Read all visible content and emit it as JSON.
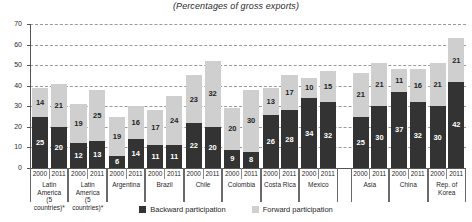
{
  "chart_data": {
    "type": "bar",
    "title": "(Percentages of gross exports)",
    "subtitle": "",
    "xlabel": "",
    "ylabel": "",
    "ylim": [
      0,
      70
    ],
    "yticks": [
      0,
      10,
      20,
      30,
      40,
      50,
      60,
      70
    ],
    "grid": true,
    "stacked": true,
    "legend_position": "bottom",
    "legend": [
      {
        "name": "Backward participation",
        "color": "#333333"
      },
      {
        "name": "Forward participation",
        "color": "#cfcfcf"
      }
    ],
    "series": [
      {
        "name": "Backward participation",
        "color": "#333333",
        "values": [
          25,
          20,
          12,
          13,
          6,
          14,
          11,
          11,
          22,
          20,
          9,
          8,
          26,
          28,
          34,
          32,
          25,
          30,
          37,
          32,
          30,
          42
        ]
      },
      {
        "name": "Forward participation",
        "color": "#cfcfcf",
        "values": [
          14,
          21,
          19,
          25,
          19,
          16,
          17,
          24,
          23,
          32,
          20,
          30,
          13,
          17,
          10,
          15,
          21,
          21,
          11,
          16,
          21,
          21
        ]
      }
    ],
    "groups": [
      {
        "name": "Latin\nAmerica\n(5 countries)*",
        "years": [
          "2000",
          "2011"
        ]
      },
      {
        "name": "Latin\nAmerica\n(5 countries)*",
        "years": [
          "2000",
          "2011"
        ]
      },
      {
        "name": "Argentina",
        "years": [
          "2000",
          "2011"
        ]
      },
      {
        "name": "Brazil",
        "years": [
          "2000",
          "2011"
        ]
      },
      {
        "name": "Chile",
        "years": [
          "2000",
          "2011"
        ]
      },
      {
        "name": "Colombia",
        "years": [
          "2000",
          "2011"
        ]
      },
      {
        "name": "Costa Rica",
        "years": [
          "2000",
          "2011"
        ]
      },
      {
        "name": "Mexico",
        "years": [
          "2000",
          "2011"
        ]
      },
      {
        "name": "Asia",
        "years": [
          "2000",
          "2011"
        ]
      },
      {
        "name": "China",
        "years": [
          "2000",
          "2011"
        ]
      },
      {
        "name": "Rep. of\nKorea",
        "years": [
          "2000",
          "2011"
        ]
      }
    ],
    "bars": [
      {
        "group": "Latin America (5 countries)*",
        "year": "2000",
        "backward": 25,
        "forward": 14,
        "total": 39
      },
      {
        "group": "Latin America (5 countries)*",
        "year": "2011",
        "backward": 20,
        "forward": 21,
        "total": 41
      },
      {
        "group": "Latin America (5 countries)*",
        "year": "2000",
        "backward": 12,
        "forward": 19,
        "total": 31
      },
      {
        "group": "Latin America (5 countries)*",
        "year": "2011",
        "backward": 13,
        "forward": 25,
        "total": 38
      },
      {
        "group": "Argentina",
        "year": "2000",
        "backward": 6,
        "forward": 19,
        "total": 25
      },
      {
        "group": "Argentina",
        "year": "2011",
        "backward": 14,
        "forward": 16,
        "total": 30
      },
      {
        "group": "Brazil",
        "year": "2000",
        "backward": 11,
        "forward": 17,
        "total": 28
      },
      {
        "group": "Brazil",
        "year": "2011",
        "backward": 11,
        "forward": 24,
        "total": 35
      },
      {
        "group": "Chile",
        "year": "2000",
        "backward": 22,
        "forward": 23,
        "total": 45
      },
      {
        "group": "Chile",
        "year": "2011",
        "backward": 20,
        "forward": 32,
        "total": 52
      },
      {
        "group": "Colombia",
        "year": "2000",
        "backward": 9,
        "forward": 20,
        "total": 29
      },
      {
        "group": "Colombia",
        "year": "2011",
        "backward": 8,
        "forward": 30,
        "total": 38
      },
      {
        "group": "Costa Rica",
        "year": "2000",
        "backward": 26,
        "forward": 13,
        "total": 39
      },
      {
        "group": "Costa Rica",
        "year": "2011",
        "backward": 28,
        "forward": 17,
        "total": 45
      },
      {
        "group": "Mexico",
        "year": "2000",
        "backward": 34,
        "forward": 10,
        "total": 44
      },
      {
        "group": "Mexico",
        "year": "2011",
        "backward": 32,
        "forward": 15,
        "total": 47
      },
      {
        "group": "Asia",
        "year": "2000",
        "backward": 25,
        "forward": 21,
        "total": 46
      },
      {
        "group": "Asia",
        "year": "2011",
        "backward": 30,
        "forward": 21,
        "total": 51
      },
      {
        "group": "China",
        "year": "2000",
        "backward": 37,
        "forward": 11,
        "total": 48
      },
      {
        "group": "China",
        "year": "2011",
        "backward": 32,
        "forward": 16,
        "total": 48
      },
      {
        "group": "Rep. of Korea",
        "year": "2000",
        "backward": 30,
        "forward": 21,
        "total": 51
      },
      {
        "group": "Rep. of Korea",
        "year": "2011",
        "backward": 42,
        "forward": 21,
        "total": 63
      }
    ]
  },
  "colors": {
    "backward": "#333333",
    "forward": "#cfcfcf",
    "axis": "#555555",
    "grid": "#9a9a9a",
    "background": "#ffffff"
  }
}
